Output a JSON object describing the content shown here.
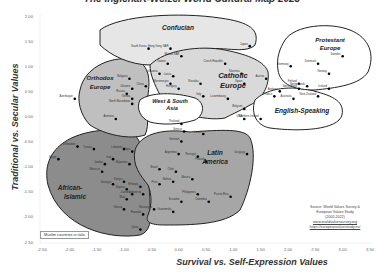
{
  "chart_data": {
    "type": "scatter",
    "title": "The Inglehart-Welzel World Cultural Map 2023",
    "xlabel": "Survival vs. Self-Expression Values",
    "ylabel": "Traditional vs. Secular Values",
    "xlim": [
      -2.5,
      3.5
    ],
    "ylim": [
      -2.5,
      2.0
    ],
    "x_ticks": [
      "-2.50",
      "-2.00",
      "-1.50",
      "-1.00",
      "-0.50",
      "0.00",
      "0.50",
      "1.00",
      "1.50",
      "2.00",
      "2.50",
      "3.00",
      "3.50"
    ],
    "y_ticks": [
      "2.00",
      "1.50",
      "1.00",
      "0.50",
      "0.00",
      "-0.50",
      "-1.00",
      "-1.50",
      "-2.00",
      "-2.50"
    ],
    "grid": false,
    "regions": [
      {
        "name": "Confucian",
        "fill": "#e6e6e6"
      },
      {
        "name": "Protestant Europe",
        "fill": "#ffffff"
      },
      {
        "name": "Catholic Europe",
        "fill": "#d9d9d9"
      },
      {
        "name": "English-Speaking",
        "fill": "#ffffff"
      },
      {
        "name": "Orthodox Europe",
        "fill": "#bfbfbf"
      },
      {
        "name": "West & South Asia",
        "fill": "#ffffff"
      },
      {
        "name": "Latin America",
        "fill": "#a6a6a6"
      },
      {
        "name": "African-Islamic",
        "fill": "#8c8c8c"
      }
    ],
    "points": [
      {
        "label": "South Korea",
        "x": -0.55,
        "y": 1.35
      },
      {
        "label": "Hong Kong SAR",
        "x": -0.15,
        "y": 1.35
      },
      {
        "label": "Macau SAR",
        "x": 0.05,
        "y": 1.2
      },
      {
        "label": "Japan",
        "x": 1.3,
        "y": 1.4
      },
      {
        "label": "Taiwan",
        "x": -0.2,
        "y": 1.05
      },
      {
        "label": "Czech Republic",
        "x": 0.85,
        "y": 1.05
      },
      {
        "label": "China",
        "x": -0.6,
        "y": 0.6
      },
      {
        "label": "Lithuania",
        "x": -0.35,
        "y": 0.85
      },
      {
        "label": "Latvia",
        "x": -0.1,
        "y": 0.8
      },
      {
        "label": "Montenegro",
        "x": -0.15,
        "y": 0.65
      },
      {
        "label": "Hungary",
        "x": 0.0,
        "y": 0.55
      },
      {
        "label": "Slovakia",
        "x": 0.4,
        "y": 0.65
      },
      {
        "label": "Slovenia",
        "x": 1.15,
        "y": 0.85
      },
      {
        "label": "Spain",
        "x": 1.2,
        "y": 0.65
      },
      {
        "label": "Italy",
        "x": 0.45,
        "y": 0.4
      },
      {
        "label": "Luxembourg",
        "x": 0.9,
        "y": 0.35
      },
      {
        "label": "Belgium",
        "x": 1.2,
        "y": 0.15
      },
      {
        "label": "Austria",
        "x": 1.6,
        "y": 0.75
      },
      {
        "label": "Andorra",
        "x": 1.85,
        "y": 0.5
      },
      {
        "label": "France",
        "x": 1.75,
        "y": 0.4
      },
      {
        "label": "Germany",
        "x": 2.05,
        "y": 1.0
      },
      {
        "label": "Finland",
        "x": 2.2,
        "y": 0.65
      },
      {
        "label": "Netherlands",
        "x": 2.35,
        "y": 0.6
      },
      {
        "label": "Switzerland",
        "x": 2.2,
        "y": 0.55
      },
      {
        "label": "Denmark",
        "x": 2.55,
        "y": 1.05
      },
      {
        "label": "Sweden",
        "x": 3.0,
        "y": 1.2
      },
      {
        "label": "Norway",
        "x": 2.75,
        "y": 0.85
      },
      {
        "label": "Iceland",
        "x": 2.75,
        "y": 0.55
      },
      {
        "label": "Australia",
        "x": 2.1,
        "y": 0.35
      },
      {
        "label": "New Zealand",
        "x": 2.55,
        "y": 0.4
      },
      {
        "label": "USA",
        "x": 1.2,
        "y": -0.05
      },
      {
        "label": "Northern Ireland",
        "x": 1.5,
        "y": -0.05
      },
      {
        "label": "Bulgaria",
        "x": -0.9,
        "y": 0.75
      },
      {
        "label": "Ukraine",
        "x": -0.85,
        "y": 0.55
      },
      {
        "label": "Russia",
        "x": -0.95,
        "y": 0.45
      },
      {
        "label": "Serbia",
        "x": -0.85,
        "y": 0.35
      },
      {
        "label": "North Macedonia",
        "x": -0.85,
        "y": 0.25
      },
      {
        "label": "Azerbaijan",
        "x": -1.9,
        "y": 0.35
      },
      {
        "label": "Armenia",
        "x": -1.15,
        "y": -0.05
      },
      {
        "label": "Thailand",
        "x": 0.05,
        "y": -0.15
      },
      {
        "label": "Greece",
        "x": 0.1,
        "y": -0.3
      },
      {
        "label": "Israel",
        "x": 0.45,
        "y": -0.35
      },
      {
        "label": "Portugal",
        "x": 0.35,
        "y": -0.8
      },
      {
        "label": "Poland",
        "x": 0.5,
        "y": -0.9
      },
      {
        "label": "Vietnam",
        "x": 0.05,
        "y": -0.5
      },
      {
        "label": "Uruguay",
        "x": 1.25,
        "y": -0.75
      },
      {
        "label": "Argentina",
        "x": 0.0,
        "y": -0.75
      },
      {
        "label": "Brazil",
        "x": -0.35,
        "y": -1.05
      },
      {
        "label": "Chile",
        "x": -0.05,
        "y": -1.1
      },
      {
        "label": "Bolivia",
        "x": -0.1,
        "y": -1.3
      },
      {
        "label": "Mexico",
        "x": 0.25,
        "y": -1.25
      },
      {
        "label": "Peru",
        "x": -0.35,
        "y": -1.35
      },
      {
        "label": "Philippines",
        "x": 0.35,
        "y": -1.55
      },
      {
        "label": "Ecuador",
        "x": 0.05,
        "y": -1.7
      },
      {
        "label": "Colombia",
        "x": 0.55,
        "y": -1.7
      },
      {
        "label": "Puerto Rico",
        "x": 0.95,
        "y": -1.6
      },
      {
        "label": "Nicaragua",
        "x": -0.45,
        "y": -1.85
      },
      {
        "label": "Guatemala",
        "x": -0.1,
        "y": -1.9
      },
      {
        "label": "Zimbabwe",
        "x": -1.85,
        "y": -0.6
      },
      {
        "label": "Egypt",
        "x": -2.2,
        "y": -0.85
      },
      {
        "label": "Tunisia",
        "x": -1.55,
        "y": -0.65
      },
      {
        "label": "Lebanon",
        "x": -1.0,
        "y": -0.65
      },
      {
        "label": "Iraq",
        "x": -1.2,
        "y": -0.85
      },
      {
        "label": "Jordan",
        "x": -1.35,
        "y": -0.95
      },
      {
        "label": "Morocco",
        "x": -1.4,
        "y": -1.1
      },
      {
        "label": "Libya",
        "x": -0.85,
        "y": -0.7
      },
      {
        "label": "Myanmar",
        "x": -0.9,
        "y": -0.95
      },
      {
        "label": "Senegal",
        "x": -1.2,
        "y": -1.35
      },
      {
        "label": "Kenya",
        "x": -1.0,
        "y": -1.3
      },
      {
        "label": "Nigeria",
        "x": -0.95,
        "y": -1.45
      },
      {
        "label": "Ethiopia",
        "x": -0.7,
        "y": -1.4
      },
      {
        "label": "Mali",
        "x": -0.95,
        "y": -1.65
      },
      {
        "label": "Zambia",
        "x": -0.85,
        "y": -1.55
      },
      {
        "label": "Ghana",
        "x": -1.0,
        "y": -1.85
      },
      {
        "label": "Rwanda",
        "x": -0.65,
        "y": -1.95
      },
      {
        "label": "Qatar",
        "x": -0.7,
        "y": -2.25
      },
      {
        "label": "Indonesia",
        "x": -0.65,
        "y": -1.55
      }
    ]
  },
  "labels": {
    "title": "The Inglehart-Welzel World Cultural Map 2023",
    "xlabel": "Survival vs. Self-Expression Values",
    "ylabel": "Traditional vs. Secular Values",
    "note": "Muslim countries in italic",
    "source_line1": "Source: World Values Survey &",
    "source_line2": "European Values Study",
    "source_line3": "(2005-2022)",
    "source_link1": "www.worldvaluessurvey.org",
    "source_link2": "https://europeanvaluesstudy.eu/"
  },
  "regions_text": {
    "confucian": "Confucian",
    "protestant1": "Protestant",
    "protestant2": "Europe",
    "catholic1": "Catholic",
    "catholic2": "Europe",
    "english": "English-Speaking",
    "orthodox1": "Orthodox",
    "orthodox2": "Europe",
    "wsa1": "West & South",
    "wsa2": "Asia",
    "latin1": "Latin",
    "latin2": "America",
    "african1": "African-",
    "african2": "Islamic"
  }
}
